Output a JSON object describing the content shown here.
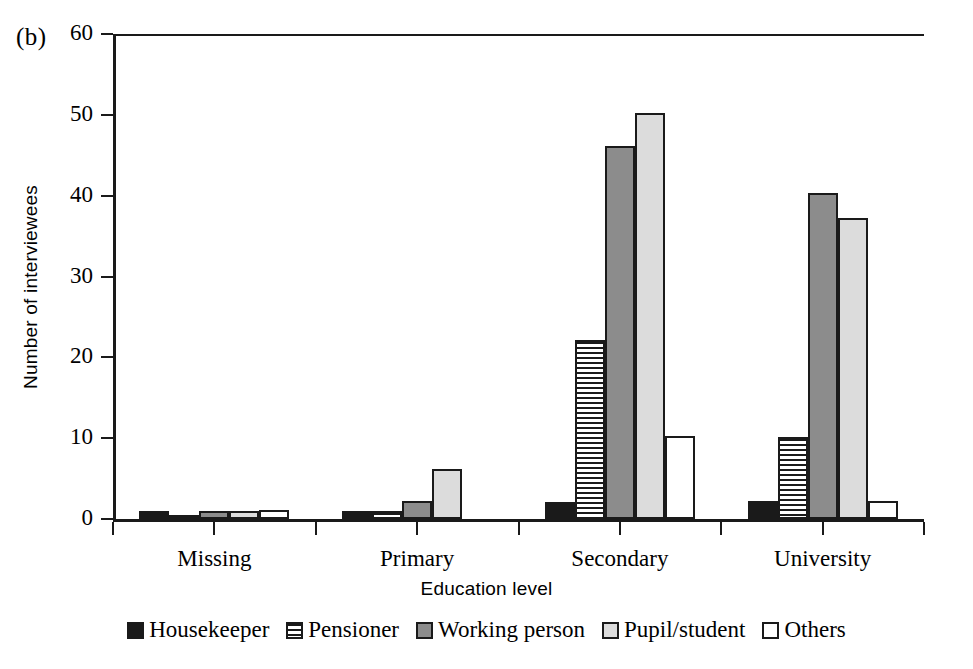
{
  "figure": {
    "panel_label": "(b)"
  },
  "chart_data": {
    "type": "bar",
    "title": "",
    "xlabel": "Education level",
    "ylabel": "Number of interviewees",
    "categories": [
      "Missing",
      "Primary",
      "Secondary",
      "University"
    ],
    "ylim": [
      0,
      60
    ],
    "yticks": [
      0,
      10,
      20,
      30,
      40,
      50,
      60
    ],
    "ytick_labels": [
      "0",
      "10",
      "20",
      "30",
      "40",
      "50",
      "60"
    ],
    "grid": false,
    "legend_position": "bottom",
    "series": [
      {
        "name": "Housekeeper",
        "color": "#1a1a1a",
        "pattern": "solid-black",
        "values": [
          1.0,
          1.0,
          2.1,
          2.2
        ]
      },
      {
        "name": "Pensioner",
        "color": "#ffffff",
        "pattern": "horizontal-stripes",
        "values": [
          0.5,
          1.0,
          22.2,
          10.2
        ]
      },
      {
        "name": "Working person",
        "color": "#8c8c8c",
        "pattern": "solid-dark-gray",
        "values": [
          1.0,
          2.2,
          46.2,
          40.3
        ]
      },
      {
        "name": "Pupil/student",
        "color": "#dcdcdc",
        "pattern": "solid-light-gray",
        "values": [
          1.0,
          6.2,
          50.2,
          37.2
        ]
      },
      {
        "name": "Others",
        "color": "#ffffff",
        "pattern": "solid-white",
        "values": [
          1.1,
          0.0,
          10.3,
          2.2
        ]
      }
    ]
  }
}
